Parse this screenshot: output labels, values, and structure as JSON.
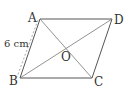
{
  "diagram": {
    "type": "parallelogram",
    "colors": {
      "stroke": "#555555",
      "dashed": "#999999",
      "text": "#333333",
      "background": "#ffffff"
    },
    "vertices": {
      "A": {
        "label": "A",
        "x": 40,
        "y": 19
      },
      "B": {
        "label": "B",
        "x": 20,
        "y": 78
      },
      "C": {
        "label": "C",
        "x": 92,
        "y": 78
      },
      "D": {
        "label": "D",
        "x": 112,
        "y": 19
      }
    },
    "center": {
      "label": "O",
      "x": 66,
      "y": 48.5
    },
    "measurement": {
      "label": "6 cm"
    }
  }
}
